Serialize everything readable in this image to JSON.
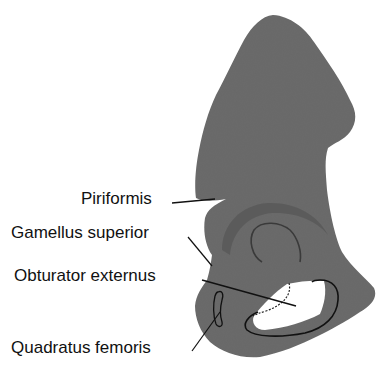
{
  "figure": {
    "colors": {
      "background": "#ffffff",
      "bone": "#6b6b6b",
      "bone_shadow": "#5a5a5a",
      "foramen": "#ffffff",
      "outline": "#111111",
      "text": "#111111"
    }
  },
  "labels": [
    {
      "id": "piriformis",
      "text": "Piriformis"
    },
    {
      "id": "gamellus-superior",
      "text": "Gamellus superior"
    },
    {
      "id": "obturator-externus",
      "text": "Obturator externus"
    },
    {
      "id": "quadratus-femoris",
      "text": "Quadratus femoris"
    }
  ]
}
